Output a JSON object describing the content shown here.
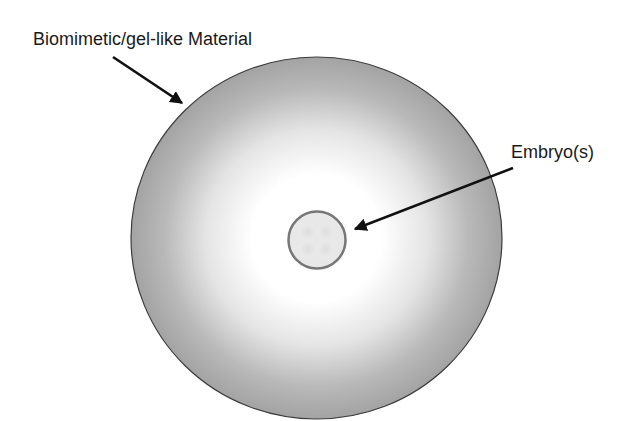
{
  "diagram": {
    "labels": {
      "material": "Biomimetic/gel-like Material",
      "embryo": "Embryo(s)"
    },
    "colors": {
      "background": "#ffffff",
      "gel_edge": "#a3a3a3",
      "gel_center": "#ffffff",
      "gel_outline": "#3c3c3c",
      "embryo_fill": "#e6e6e6",
      "embryo_ring": "#777777",
      "arrow": "#111111"
    },
    "shapes": {
      "gel_sphere": {
        "cx": 316.5,
        "cy": 238,
        "r": 183
      },
      "embryo": {
        "cx": 317,
        "cy": 240,
        "r": 29
      }
    },
    "arrows": [
      {
        "name": "material-arrow",
        "x1": 113,
        "y1": 57,
        "x2": 182,
        "y2": 103
      },
      {
        "name": "embryo-arrow",
        "x1": 513,
        "y1": 168,
        "x2": 355,
        "y2": 229
      }
    ]
  }
}
